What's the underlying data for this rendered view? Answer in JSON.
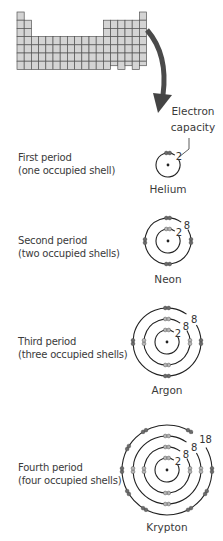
{
  "diagram": {
    "periodic_table": {
      "columns": 18,
      "rows": 7,
      "fill": "#d4d4d4",
      "stroke": "#555555"
    },
    "arrow_color": "#555555",
    "electron_capacity_label": [
      "Electron",
      "capacity"
    ],
    "periods": [
      {
        "title": "First period",
        "subtitle": "(one occupied shell)",
        "element": "Helium",
        "shell_capacities": [
          2
        ]
      },
      {
        "title": "Second period",
        "subtitle": "(two occupied shells)",
        "element": "Neon",
        "shell_capacities": [
          2,
          8
        ]
      },
      {
        "title": "Third period",
        "subtitle": "(three occupied shells)",
        "element": "Argon",
        "shell_capacities": [
          2,
          8,
          8
        ]
      },
      {
        "title": "Fourth period",
        "subtitle": "(four occupied shells)",
        "element": "Krypton",
        "shell_capacities": [
          2,
          8,
          8,
          18
        ]
      }
    ],
    "colors": {
      "filled_electron": "#6a6a6a",
      "partial_electron": "#b5b5b5",
      "shell_line": "#222222"
    }
  }
}
